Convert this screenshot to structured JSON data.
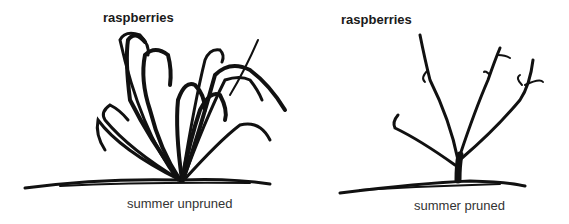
{
  "panels": [
    {
      "title": "raspberries",
      "caption": "summer unpruned"
    },
    {
      "title": "raspberries",
      "caption": "summer pruned"
    }
  ]
}
